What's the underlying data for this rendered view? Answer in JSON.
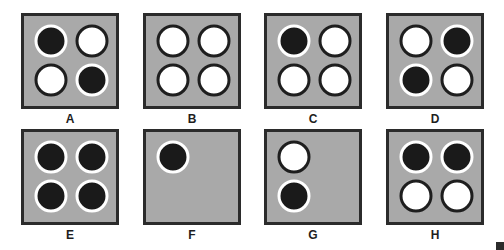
{
  "colors": {
    "panel_bg": "#a9a9a9",
    "panel_border": "#2b2b2b",
    "filled": "#1a1a1a",
    "empty": "#ffffff"
  },
  "panels": [
    {
      "label": "A",
      "cells": {
        "top_left": "black",
        "top_right": "white",
        "bottom_left": "white",
        "bottom_right": "black"
      }
    },
    {
      "label": "B",
      "cells": {
        "top_left": "white",
        "top_right": "white",
        "bottom_left": "white",
        "bottom_right": "white"
      }
    },
    {
      "label": "C",
      "cells": {
        "top_left": "black",
        "top_right": "white",
        "bottom_left": "white",
        "bottom_right": "white"
      }
    },
    {
      "label": "D",
      "cells": {
        "top_left": "white",
        "top_right": "black",
        "bottom_left": "black",
        "bottom_right": "white"
      }
    },
    {
      "label": "E",
      "cells": {
        "top_left": "black",
        "top_right": "black",
        "bottom_left": "black",
        "bottom_right": "black"
      }
    },
    {
      "label": "F",
      "cells": {
        "top_left": "black",
        "top_right": null,
        "bottom_left": null,
        "bottom_right": null
      }
    },
    {
      "label": "G",
      "cells": {
        "top_left": "white",
        "top_right": null,
        "bottom_left": "black",
        "bottom_right": null
      }
    },
    {
      "label": "H",
      "cells": {
        "top_left": "black",
        "top_right": "black",
        "bottom_left": "white",
        "bottom_right": "white"
      }
    }
  ]
}
